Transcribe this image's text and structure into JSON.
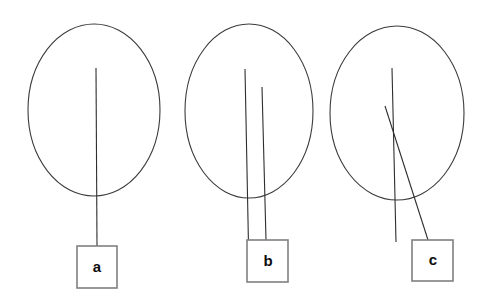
{
  "figure": {
    "title": "",
    "background_color": "#ffffff",
    "width": 484,
    "height": 302,
    "stroke_color": "#2e2e2e",
    "ellipse_stroke_color": "#3b3b3b",
    "box_stroke_color": "#808080",
    "label_color": "#0d0d0d"
  },
  "panels": [
    {
      "id": "panel-a",
      "label": "a",
      "ellipse": {
        "cx": 94,
        "cy": 110,
        "rx": 66,
        "ry": 86
      },
      "box": {
        "x": 77,
        "y": 246,
        "width": 40,
        "height": 42
      },
      "label_x": 97,
      "label_y": 268,
      "lines": [
        {
          "name": "stem-1",
          "x1": 96,
          "y1": 68,
          "x2": 97,
          "y2": 246
        }
      ]
    },
    {
      "id": "panel-b",
      "label": "b",
      "ellipse": {
        "cx": 249,
        "cy": 111,
        "rx": 64,
        "ry": 87
      },
      "box": {
        "x": 247,
        "y": 240,
        "width": 41,
        "height": 42
      },
      "label_x": 268,
      "label_y": 262,
      "lines": [
        {
          "name": "stem-1",
          "x1": 245,
          "y1": 69,
          "x2": 249,
          "y2": 271
        },
        {
          "name": "stem-2",
          "x1": 262,
          "y1": 87,
          "x2": 266,
          "y2": 240
        }
      ]
    },
    {
      "id": "panel-c",
      "label": "c",
      "ellipse": {
        "cx": 397,
        "cy": 113,
        "rx": 67,
        "ry": 87
      },
      "box": {
        "x": 412,
        "y": 240,
        "width": 41,
        "height": 41
      },
      "label_x": 433,
      "label_y": 261,
      "lines": [
        {
          "name": "stem-vertical",
          "x1": 392,
          "y1": 68,
          "x2": 396,
          "y2": 242
        },
        {
          "name": "stem-diagonal",
          "x1": 385,
          "y1": 106,
          "x2": 428,
          "y2": 240
        }
      ]
    }
  ]
}
